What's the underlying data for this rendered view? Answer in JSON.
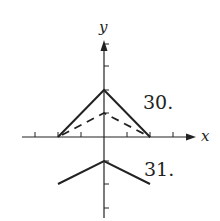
{
  "figure": {
    "axes": {
      "x_label": "x",
      "y_label": "y",
      "origin_px": [
        104,
        137
      ],
      "unit_px": 23,
      "x_ticks": [
        -3,
        -2,
        -1,
        1,
        2,
        3
      ],
      "y_ticks": [
        -3,
        -2,
        -1,
        1,
        2,
        3,
        4
      ]
    },
    "graphs": [
      {
        "label": "30.",
        "curves": [
          {
            "style": "solid",
            "points": [
              [
                -3,
                0
              ],
              [
                0,
                2
              ],
              [
                3,
                0
              ]
            ]
          },
          {
            "style": "dashed",
            "points": [
              [
                -3,
                0
              ],
              [
                0,
                1
              ],
              [
                3,
                0
              ]
            ]
          }
        ]
      },
      {
        "label": "31.",
        "curves": [
          {
            "style": "solid",
            "points": [
              [
                -3,
                -2
              ],
              [
                0,
                -1
              ],
              [
                3,
                -2
              ]
            ]
          }
        ]
      }
    ],
    "colors": {
      "ink": "#222222",
      "background": "#ffffff"
    }
  }
}
